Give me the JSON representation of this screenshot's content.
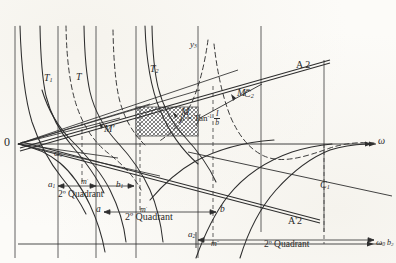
{
  "figure": {
    "kind": "engineering-nomogram",
    "origin_label": "0",
    "ink_color": "#2e2e2e",
    "paper_color": "#fcfbf8",
    "hatch_color": "#6a6a6a"
  },
  "curve_labels": [
    {
      "id": "T1",
      "text": "T",
      "sub": "1",
      "x": 44,
      "y": 80
    },
    {
      "id": "T",
      "text": "T",
      "sub": "",
      "x": 76,
      "y": 79
    },
    {
      "id": "T2",
      "text": "T",
      "sub": "2",
      "x": 150,
      "y": 70
    },
    {
      "id": "y3",
      "text": "y",
      "sub": "3",
      "x": 190,
      "y": 44
    }
  ],
  "line_labels": [
    {
      "id": "A2",
      "text": "A 2",
      "x": 298,
      "y": 66
    },
    {
      "id": "A2p",
      "text": "A'2",
      "x": 290,
      "y": 222
    },
    {
      "id": "C2",
      "text": "C",
      "sub": "2",
      "x": 246,
      "y": 95
    },
    {
      "id": "C1",
      "text": "C",
      "sub": "1",
      "x": 322,
      "y": 186
    }
  ],
  "point_labels": [
    {
      "id": "M",
      "text": "M",
      "x": 182,
      "y": 113
    },
    {
      "id": "Mprime",
      "text": "M'",
      "x": 105,
      "y": 130
    },
    {
      "id": "Mdbl",
      "text": "M\"",
      "x": 238,
      "y": 94
    },
    {
      "id": "omega0",
      "text": "ω",
      "sub": "0",
      "x": 55,
      "y": 155
    }
  ],
  "axis_labels": [
    {
      "id": "omega-right",
      "text": "ω",
      "sub": "",
      "x": 379,
      "y": 142
    },
    {
      "id": "omega-bottom",
      "text": "ω",
      "sub": "0",
      "x": 377,
      "y": 244
    }
  ],
  "formula": {
    "beta": "β",
    "equals": "=",
    "fn": "Tan",
    "exponent": "-1",
    "numerator": "I",
    "denominator": "b"
  },
  "quadrants": [
    {
      "id": "q-upper-left",
      "caption": "2º Quadrant",
      "caption_x": 58,
      "caption_y": 196,
      "left_tick": "a",
      "left_tick_sub": "1",
      "left_x": 48,
      "left_y": 184,
      "mid_tick": "m",
      "mid_tick_sup": "'",
      "mid_x": 82,
      "mid_y": 183,
      "right_tick": "b",
      "right_tick_sub": "1",
      "right_x": 116,
      "right_y": 184
    },
    {
      "id": "q-middle",
      "caption": "2º Quadrant",
      "caption_x": 125,
      "caption_y": 217,
      "left_tick": "a",
      "left_tick_sub": "",
      "left_x": 97,
      "left_y": 209,
      "mid_tick": "m",
      "mid_tick_sup": "'",
      "mid_x": 140,
      "mid_y": 209,
      "right_tick": "b",
      "right_tick_sub": "",
      "right_x": 200,
      "right_y": 209
    },
    {
      "id": "q-lower-right",
      "caption": "2º Quadrant",
      "caption_x": 266,
      "caption_y": 246,
      "left_tick": "a",
      "left_tick_sub": "2",
      "left_x": 188,
      "left_y": 236,
      "mid_tick": "m",
      "mid_tick_sup": "\"",
      "mid_x": 213,
      "mid_y": 245,
      "right_tick": "b",
      "right_tick_sub": "2",
      "right_x": 389,
      "right_y": 245
    }
  ],
  "hatched_region": {
    "label": "shaded-area",
    "x": 136,
    "y": 107,
    "w": 62,
    "h": 29
  },
  "geometry": {
    "origin": {
      "x": 18,
      "y": 144
    },
    "baseline_y": 144,
    "vertical_rules_x": [
      15,
      58,
      96,
      136,
      198,
      261,
      324
    ],
    "bottom_rule_y": 244
  }
}
